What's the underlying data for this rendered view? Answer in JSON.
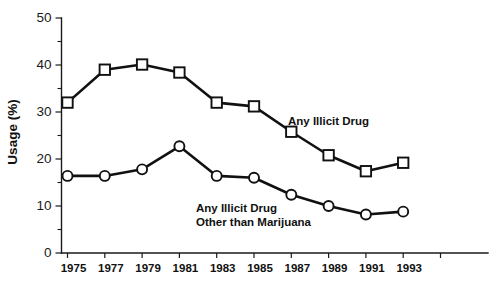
{
  "chart_data": {
    "type": "line",
    "title": "",
    "xlabel": "",
    "ylabel": "Usage (%)",
    "ylim": [
      0,
      50
    ],
    "yticks": [
      0,
      10,
      20,
      30,
      40,
      50
    ],
    "ytick_labels": [
      "0",
      "10",
      "20",
      "30",
      "40",
      "50"
    ],
    "yminor_step": 5,
    "grid": false,
    "legend_position": "inline-annotations",
    "categories": [
      1975,
      1977,
      1979,
      1981,
      1983,
      1985,
      1987,
      1989,
      1991,
      1993
    ],
    "xtick_labels": [
      "1975",
      "1977",
      "1979",
      "1981",
      "1983",
      "1985",
      "1987",
      "1989",
      "1991",
      "1993"
    ],
    "series": [
      {
        "name": "Any Illicit Drug",
        "marker": "square",
        "label_lines": [
          "Any Illicit Drug"
        ],
        "values": [
          32.0,
          39.0,
          40.1,
          38.4,
          32.0,
          31.2,
          25.8,
          20.8,
          17.4,
          19.2
        ]
      },
      {
        "name": "Any Illicit Drug Other than Marijuana",
        "marker": "circle",
        "label_lines": [
          "Any Illicit Drug",
          "Other than Marijuana"
        ],
        "values": [
          16.4,
          16.4,
          17.8,
          22.7,
          16.4,
          16.0,
          12.4,
          10.0,
          8.2,
          8.8
        ]
      }
    ]
  },
  "colors": {
    "line": "#111111",
    "marker_fill": "#ffffff",
    "axis": "#1a1a1a",
    "background": "#ffffff"
  }
}
